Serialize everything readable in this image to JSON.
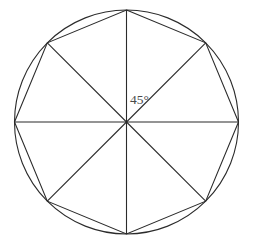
{
  "figure": {
    "background_color": "#ffffff",
    "stroke_color": "#2b2b2b",
    "label_color": "#4a4a4a",
    "angle_label": "45°",
    "angle_label_x": 130,
    "angle_label_y": 104
  },
  "chart_data": {
    "type": "diagram",
    "shape": "regular-octagon-inscribed-in-circle",
    "center": {
      "x": 126.5,
      "y": 122
    },
    "circle": {
      "cx": 126.5,
      "cy": 122,
      "r": 112
    },
    "polygon": {
      "sides": 8,
      "name": "regular octagon",
      "circumradius": 112,
      "central_angle_deg": 45,
      "vertex_angles_deg": [
        90,
        45,
        0,
        315,
        270,
        225,
        180,
        135
      ],
      "points": [
        {
          "label": "top",
          "angle_deg": 90,
          "x": 126.5,
          "y": 10
        },
        {
          "label": "north-east",
          "angle_deg": 45,
          "x": 205.7,
          "y": 42.8
        },
        {
          "label": "right",
          "angle_deg": 0,
          "x": 238.5,
          "y": 122
        },
        {
          "label": "south-east",
          "angle_deg": 315,
          "x": 205.7,
          "y": 201.2
        },
        {
          "label": "bottom",
          "angle_deg": 270,
          "x": 126.5,
          "y": 234
        },
        {
          "label": "south-west",
          "angle_deg": 225,
          "x": 47.3,
          "y": 201.2
        },
        {
          "label": "left",
          "angle_deg": 180,
          "x": 14.5,
          "y": 122
        },
        {
          "label": "north-west",
          "angle_deg": 135,
          "x": 47.3,
          "y": 42.8
        }
      ]
    },
    "radii": [
      {
        "to_vertex": "top",
        "angle_deg": 90
      },
      {
        "to_vertex": "north-east",
        "angle_deg": 45
      },
      {
        "to_vertex": "right",
        "angle_deg": 0
      },
      {
        "to_vertex": "south-east",
        "angle_deg": 315
      },
      {
        "to_vertex": "bottom",
        "angle_deg": 270
      },
      {
        "to_vertex": "south-west",
        "angle_deg": 225
      },
      {
        "to_vertex": "left",
        "angle_deg": 180
      },
      {
        "to_vertex": "north-west",
        "angle_deg": 135
      }
    ],
    "annotations": [
      {
        "text": "45°",
        "x": 130,
        "y": 104,
        "describes": "central angle between the vertical radius and the north-east radius"
      }
    ],
    "grid": false,
    "legend": false
  }
}
